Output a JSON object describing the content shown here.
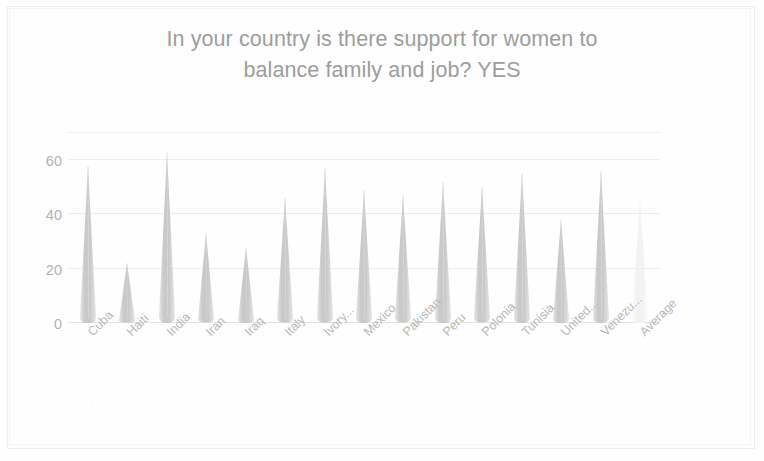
{
  "chart_data": {
    "type": "bar",
    "title": "In your country is there support for women to balance family and job? YES",
    "title_line1": "In your country is there support for women to",
    "title_line2": "balance family and job? YES",
    "xlabel": "",
    "ylabel": "",
    "ylim": [
      0,
      70
    ],
    "yticks": [
      0,
      20,
      40,
      60
    ],
    "grid": true,
    "legend": "none",
    "bar_style": "cone",
    "categories": [
      "Cuba",
      "Haiti",
      "India",
      "Iran",
      "Iraq",
      "Italy",
      "Ivory...",
      "Mexico",
      "Pakistan",
      "Peru",
      "Polonia",
      "Tunisia",
      "United...",
      "Venezu...",
      "Average"
    ],
    "values": [
      58,
      22,
      63,
      33,
      28,
      46,
      57,
      49,
      47,
      52,
      50,
      55,
      38,
      56,
      45
    ],
    "faded_last_bar": true,
    "colors": {
      "bar": "#c9c9c9",
      "bar_light": "#e6e6e6",
      "bar_last": "#f2f2f2",
      "text": "#b3b3b3",
      "title": "#9d9d9d",
      "grid": "#ececec",
      "background": "#fefefe"
    }
  }
}
